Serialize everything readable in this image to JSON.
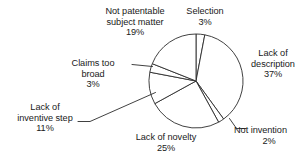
{
  "chart_data": {
    "type": "pie",
    "title": "",
    "subtitle": "",
    "xlabel": "",
    "ylabel": "",
    "legend_position": "none",
    "grid": false,
    "value_unit": "percent",
    "start_angle_deg": 0,
    "direction": "clockwise",
    "categories": [
      "Selection",
      "Lack of description",
      "Not invention",
      "Lack of novelty",
      "Lack of inventive step",
      "Claims too broad",
      "Not patentable subject matter"
    ],
    "values": [
      3,
      37,
      2,
      25,
      11,
      3,
      19
    ],
    "slices": [
      {
        "label": "Selection",
        "value": 3,
        "value_text": "3%",
        "label_lines": [
          "Selection",
          "3%"
        ],
        "has_leader": false
      },
      {
        "label": "Lack of description",
        "value": 37,
        "value_text": "37%",
        "label_lines": [
          "Lack of",
          "description",
          "37%"
        ],
        "has_leader": false
      },
      {
        "label": "Not invention",
        "value": 2,
        "value_text": "2%",
        "label_lines": [
          "Not invention",
          "2%"
        ],
        "has_leader": true
      },
      {
        "label": "Lack of novelty",
        "value": 25,
        "value_text": "25%",
        "label_lines": [
          "Lack of novelty",
          "25%"
        ],
        "has_leader": false
      },
      {
        "label": "Lack of inventive step",
        "value": 11,
        "value_text": "11%",
        "label_lines": [
          "Lack of",
          "inventive step",
          "11%"
        ],
        "has_leader": true
      },
      {
        "label": "Claims too broad",
        "value": 3,
        "value_text": "3%",
        "label_lines": [
          "Claims too",
          "broad",
          "3%"
        ],
        "has_leader": true
      },
      {
        "label": "Not patentable subject matter",
        "value": 19,
        "value_text": "19%",
        "label_lines": [
          "Not patentable",
          "subject matter",
          "19%"
        ],
        "has_leader": false
      }
    ],
    "colors": {
      "slice_fill": "#ffffff",
      "slice_stroke": "#2b2b2b",
      "text": "#1a1a1a",
      "background": "#ffffff"
    }
  },
  "labels": {
    "not_patentable": {
      "l1": "Not patentable",
      "l2": "subject matter",
      "l3": "19%"
    },
    "selection": {
      "l1": "Selection",
      "l2": "3%"
    },
    "description": {
      "l1": "Lack of",
      "l2": "description",
      "l3": "37%"
    },
    "not_invention": {
      "l1": "Not invention",
      "l2": "2%"
    },
    "novelty": {
      "l1": "Lack of novelty",
      "l2": "25%"
    },
    "inventive_step": {
      "l1": "Lack of",
      "l2": "inventive step",
      "l3": "11%"
    },
    "claims_too_broad": {
      "l1": "Claims too",
      "l2": "broad",
      "l3": "3%"
    }
  }
}
